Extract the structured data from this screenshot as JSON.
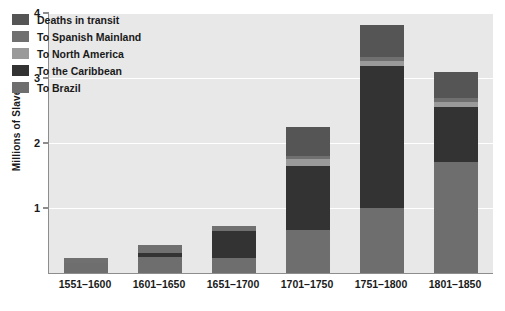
{
  "chart_data": {
    "type": "bar",
    "subtype": "stacked-bar",
    "title": "",
    "xlabel": "",
    "ylabel": "Millions of Slaves",
    "ylim": [
      0,
      4
    ],
    "yticks": [
      0,
      1,
      2,
      3,
      4
    ],
    "ytick_labels": [
      "",
      "1",
      "2",
      "3",
      "4"
    ],
    "grid": true,
    "grid_axis": "y",
    "legend_position": "upper-left-inside",
    "categories": [
      "1551–1600",
      "1601–1650",
      "1651–1700",
      "1701–1750",
      "1751–1800",
      "1801–1850"
    ],
    "series": [
      {
        "name": "To Brazil",
        "color": "#6e6e6e",
        "values": [
          0.15,
          0.25,
          0.23,
          0.66,
          1.0,
          1.71
        ]
      },
      {
        "name": "To the Caribbean",
        "color": "#333333",
        "values": [
          0.0,
          0.06,
          0.42,
          0.98,
          2.18,
          0.85
        ]
      },
      {
        "name": "To North America",
        "color": "#9a9a9a",
        "values": [
          0.0,
          0.0,
          0.0,
          0.11,
          0.08,
          0.07
        ]
      },
      {
        "name": "To Spanish Mainland",
        "color": "#707070",
        "values": [
          0.08,
          0.12,
          0.07,
          0.05,
          0.07,
          0.06
        ]
      },
      {
        "name": "Deaths in transit",
        "color": "#555555",
        "values": [
          0.0,
          0.0,
          0.0,
          0.45,
          0.49,
          0.4
        ]
      }
    ],
    "stack_order_bottom_to_top": [
      "To Brazil",
      "To the Caribbean",
      "To North America",
      "To Spanish Mainland",
      "Deaths in transit"
    ],
    "totals": [
      0.23,
      0.43,
      0.72,
      2.25,
      3.82,
      3.09
    ]
  },
  "legend": {
    "items": [
      {
        "label": "Deaths in transit",
        "color": "#555555"
      },
      {
        "label": "To Spanish Mainland",
        "color": "#707070"
      },
      {
        "label": "To North America",
        "color": "#9a9a9a"
      },
      {
        "label": "To the Caribbean",
        "color": "#333333"
      },
      {
        "label": "To Brazil",
        "color": "#6e6e6e"
      }
    ]
  },
  "axis": {
    "y_title": "Millions of Slaves",
    "y_tick_labels": [
      "4",
      "3",
      "2",
      "1"
    ],
    "x_tick_labels": [
      "1551–1600",
      "1601–1650",
      "1651–1700",
      "1701–1750",
      "1751–1800",
      "1801–1850"
    ]
  },
  "colors": {
    "plot_background": "#e8e8e8",
    "page_background": "#ffffff",
    "gridline": "#ffffff",
    "axis_line": "#8d8d8d",
    "text": "#1a1a1a"
  }
}
